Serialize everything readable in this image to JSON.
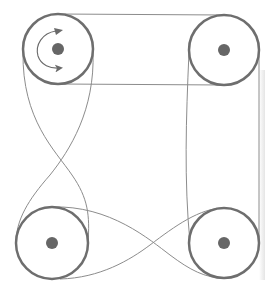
{
  "diagram": {
    "type": "belt-pulley-system",
    "colors": {
      "background": "#ffffff",
      "pulley_rim": "#6e6e6e",
      "hub": "#666666",
      "belt": "#8c8c8c",
      "arrow": "#6a6a6a"
    },
    "pulleys": [
      {
        "id": "top-left",
        "cx": 58,
        "cy": 49,
        "r": 35,
        "hub_r": 6,
        "has_rotation_arrow": true,
        "rotation": "clockwise"
      },
      {
        "id": "top-right",
        "cx": 224,
        "cy": 50,
        "r": 35,
        "hub_r": 6,
        "has_rotation_arrow": false
      },
      {
        "id": "bottom-left",
        "cx": 52,
        "cy": 243,
        "r": 36,
        "hub_r": 6,
        "has_rotation_arrow": false
      },
      {
        "id": "bottom-right",
        "cx": 224,
        "cy": 243,
        "r": 35,
        "hub_r": 6,
        "has_rotation_arrow": false
      }
    ],
    "belt_segments": [
      {
        "from": "top-left",
        "to": "top-right",
        "kind": "open",
        "side": "top"
      },
      {
        "from": "top-left",
        "to": "top-right",
        "kind": "open",
        "side": "bottom"
      },
      {
        "from": "top-right",
        "to": "bottom-right",
        "kind": "open",
        "side": "right"
      },
      {
        "from": "top-right",
        "to": "bottom-right",
        "kind": "open",
        "side": "left-inner"
      },
      {
        "from": "top-left",
        "to": "bottom-left",
        "kind": "crossed"
      },
      {
        "from": "bottom-left",
        "to": "bottom-right",
        "kind": "crossed"
      }
    ]
  }
}
